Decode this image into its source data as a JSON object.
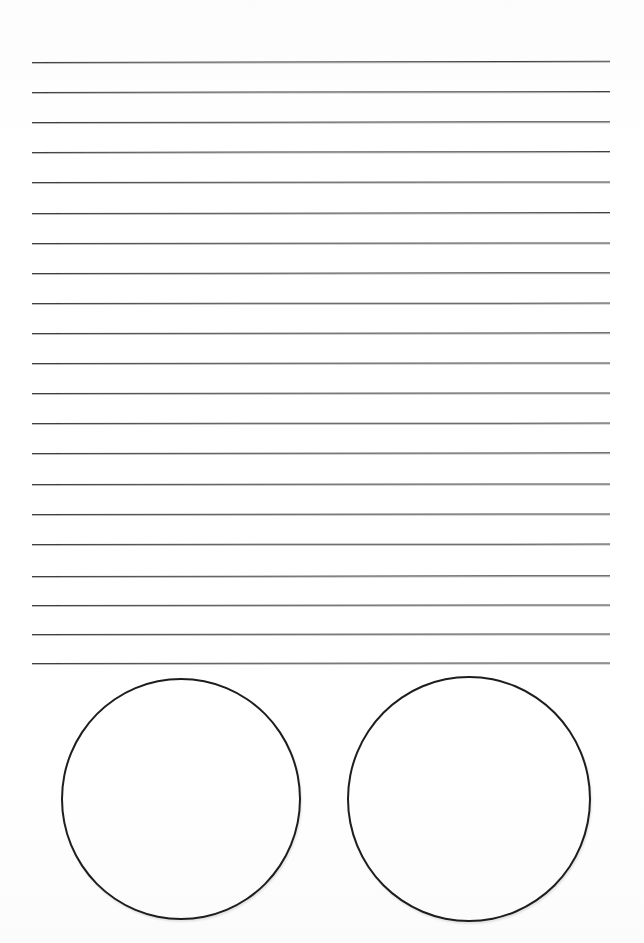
{
  "page": {
    "kind": "worksheet-page",
    "background_color": "#ffffff",
    "width": 644,
    "height": 943
  },
  "ruled_lines": {
    "name": "writing-lines",
    "count": 21,
    "color": "#3a3a3c",
    "thickness_px": 1.6,
    "x_start": 32,
    "x_end": 610,
    "first_line_y": 62,
    "spacing_px": 30,
    "lines": [
      {
        "index": 1,
        "y": 62,
        "x1": 32,
        "x2": 610,
        "skew_deg": -0.12
      },
      {
        "index": 2,
        "y": 92,
        "x1": 32,
        "x2": 610,
        "skew_deg": -0.1
      },
      {
        "index": 3,
        "y": 122,
        "x1": 32,
        "x2": 610,
        "skew_deg": -0.08
      },
      {
        "index": 4,
        "y": 152,
        "x1": 32,
        "x2": 610,
        "skew_deg": -0.1
      },
      {
        "index": 5,
        "y": 182,
        "x1": 32,
        "x2": 610,
        "skew_deg": -0.06
      },
      {
        "index": 6,
        "y": 213,
        "x1": 32,
        "x2": 610,
        "skew_deg": -0.09
      },
      {
        "index": 7,
        "y": 243,
        "x1": 32,
        "x2": 610,
        "skew_deg": -0.05
      },
      {
        "index": 8,
        "y": 273,
        "x1": 32,
        "x2": 610,
        "skew_deg": -0.08
      },
      {
        "index": 9,
        "y": 303,
        "x1": 32,
        "x2": 610,
        "skew_deg": -0.04
      },
      {
        "index": 10,
        "y": 333,
        "x1": 32,
        "x2": 610,
        "skew_deg": -0.07
      },
      {
        "index": 11,
        "y": 363,
        "x1": 32,
        "x2": 610,
        "skew_deg": -0.05
      },
      {
        "index": 12,
        "y": 393,
        "x1": 32,
        "x2": 610,
        "skew_deg": -0.06
      },
      {
        "index": 13,
        "y": 423,
        "x1": 32,
        "x2": 610,
        "skew_deg": -0.04
      },
      {
        "index": 14,
        "y": 453,
        "x1": 32,
        "x2": 610,
        "skew_deg": -0.07
      },
      {
        "index": 15,
        "y": 484,
        "x1": 32,
        "x2": 610,
        "skew_deg": -0.05
      },
      {
        "index": 16,
        "y": 514,
        "x1": 32,
        "x2": 610,
        "skew_deg": -0.06
      },
      {
        "index": 17,
        "y": 544,
        "x1": 32,
        "x2": 610,
        "skew_deg": -0.04
      },
      {
        "index": 18,
        "y": 576,
        "x1": 32,
        "x2": 610,
        "skew_deg": -0.08
      },
      {
        "index": 19,
        "y": 605,
        "x1": 32,
        "x2": 610,
        "skew_deg": -0.05
      },
      {
        "index": 20,
        "y": 634,
        "x1": 32,
        "x2": 610,
        "skew_deg": -0.06
      },
      {
        "index": 21,
        "y": 663,
        "x1": 32,
        "x2": 610,
        "skew_deg": -0.05
      }
    ]
  },
  "circles": {
    "name": "answer-circles",
    "count": 2,
    "stroke_color": "#1d1d1f",
    "stroke_width_px": 2.4,
    "fill_color": "#ffffff",
    "items": [
      {
        "index": 1,
        "position": "left",
        "left": 61,
        "top": 18,
        "width": 236,
        "height": 238
      },
      {
        "index": 2,
        "position": "right",
        "left": 347,
        "top": 16,
        "width": 240,
        "height": 242
      }
    ]
  }
}
